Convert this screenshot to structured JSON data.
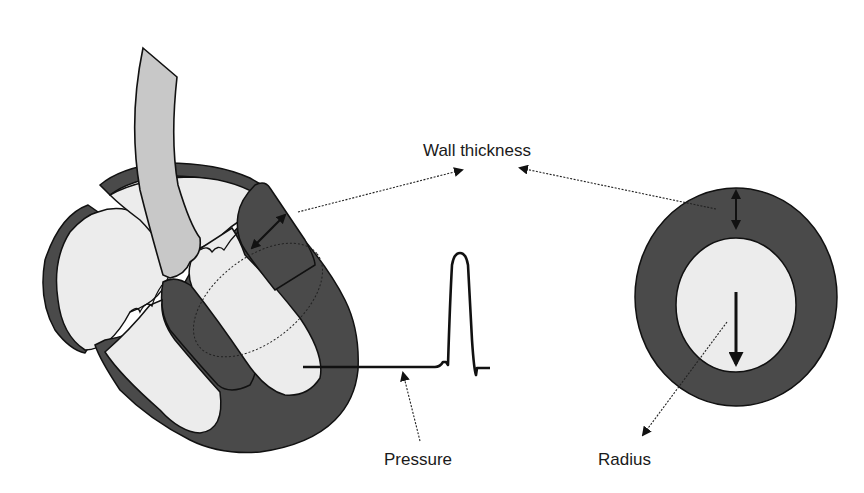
{
  "diagram": {
    "type": "anatomical-schematic",
    "labels": {
      "wall_thickness": "Wall thickness",
      "pressure": "Pressure",
      "radius": "Radius"
    },
    "components": [
      {
        "id": "heart",
        "description": "Cross-section of heart with aorta, atria, and ventricles; dashed ellipse marks LV short-axis section"
      },
      {
        "id": "pressure-trace",
        "description": "Ventricular pressure waveform with flat diastolic baseline and single systolic peak"
      },
      {
        "id": "lv-cross-section",
        "description": "Circular short-axis section: dark myocardial ring around light cavity"
      }
    ],
    "colors": {
      "myocardium": "#4a4a4a",
      "cavity": "#ececec",
      "aorta": "#c8c8c8",
      "outline": "#111111",
      "background": "#ffffff"
    }
  }
}
